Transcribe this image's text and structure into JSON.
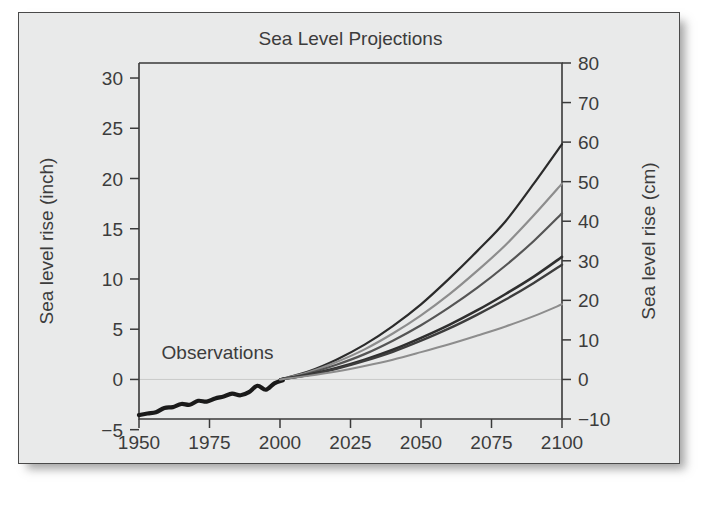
{
  "figure": {
    "title": "Sea Level Projections",
    "background_color": "#e9eaea",
    "border_color": "#4a4a4a",
    "annotation": "Observations"
  },
  "chart_data": {
    "type": "line",
    "title": "Sea Level Projections",
    "xlabel": "",
    "ylabel": "Sea level rise (inch)",
    "ylabel_right": "Sea level rise (cm)",
    "xlim": [
      1950,
      2100
    ],
    "ylim_inch": [
      -5,
      30
    ],
    "ylim_cm": [
      -10,
      80
    ],
    "grid": false,
    "legend": "none",
    "annotations": [
      {
        "text": "Observations",
        "x": 1958,
        "y_inch": 2.0
      }
    ],
    "x_ticks": [
      1950,
      1975,
      2000,
      2025,
      2050,
      2075,
      2100
    ],
    "x_ticklabels": [
      "1950",
      "1975",
      "2000",
      "2025",
      "2050",
      "2075",
      "2100"
    ],
    "y_ticks_left_inch": [
      -5,
      0,
      5,
      10,
      15,
      20,
      25,
      30
    ],
    "y_ticklabels_left": [
      "−5",
      "0",
      "5",
      "10",
      "15",
      "20",
      "25",
      "30"
    ],
    "y_ticks_right_cm": [
      -10,
      0,
      10,
      20,
      30,
      40,
      50,
      60,
      70,
      80
    ],
    "y_ticklabels_right": [
      "−10",
      "0",
      "10",
      "20",
      "30",
      "40",
      "50",
      "60",
      "70",
      "80"
    ],
    "unit_note": "left axis in inches, right axis in centimetres; 1 inch = 2.54 cm",
    "series": [
      {
        "name": "Observations",
        "color": "#1a1a1a",
        "width": 4.2,
        "x": [
          1950,
          1953,
          1956,
          1959,
          1962,
          1965,
          1968,
          1971,
          1974,
          1977,
          1980,
          1983,
          1986,
          1989,
          1992,
          1995,
          1998,
          2001
        ],
        "values_cm": [
          -9.0,
          -8.6,
          -8.3,
          -7.2,
          -7.0,
          -6.2,
          -6.4,
          -5.4,
          -5.6,
          -4.8,
          -4.3,
          -3.6,
          -4.0,
          -3.2,
          -1.6,
          -2.6,
          -1.0,
          -0.2
        ]
      },
      {
        "name": "Projection high",
        "color": "#2b2b2b",
        "width": 2.2,
        "x": [
          2000,
          2010,
          2020,
          2030,
          2040,
          2050,
          2060,
          2070,
          2080,
          2090,
          2100
        ],
        "values_cm": [
          0,
          2.0,
          5.0,
          8.8,
          13.5,
          19.0,
          25.5,
          32.5,
          40.0,
          49.5,
          59.5
        ]
      },
      {
        "name": "Projection upper-mid",
        "color": "#8d8d8d",
        "width": 2.2,
        "x": [
          2000,
          2010,
          2020,
          2030,
          2040,
          2050,
          2060,
          2070,
          2080,
          2090,
          2100
        ],
        "values_cm": [
          0,
          1.8,
          4.4,
          7.6,
          11.6,
          16.2,
          21.5,
          27.5,
          34.0,
          41.5,
          49.5
        ]
      },
      {
        "name": "Projection mid-high",
        "color": "#555555",
        "width": 2.2,
        "x": [
          2000,
          2010,
          2020,
          2030,
          2040,
          2050,
          2060,
          2070,
          2080,
          2090,
          2100
        ],
        "values_cm": [
          0,
          1.5,
          3.7,
          6.4,
          9.8,
          13.7,
          18.2,
          23.2,
          28.8,
          35.0,
          42.0
        ]
      },
      {
        "name": "Projection mid",
        "color": "#2f2f2f",
        "width": 2.6,
        "x": [
          2000,
          2010,
          2020,
          2030,
          2040,
          2050,
          2060,
          2070,
          2080,
          2090,
          2100
        ],
        "values_cm": [
          0,
          1.2,
          2.9,
          5.0,
          7.5,
          10.5,
          13.8,
          17.5,
          21.6,
          26.0,
          31.0
        ]
      },
      {
        "name": "Projection mid-low",
        "color": "#3d3d3d",
        "width": 2.4,
        "x": [
          2000,
          2010,
          2020,
          2030,
          2040,
          2050,
          2060,
          2070,
          2080,
          2090,
          2100
        ],
        "values_cm": [
          0,
          1.1,
          2.7,
          4.7,
          7.0,
          9.8,
          12.9,
          16.4,
          20.2,
          24.4,
          29.0
        ]
      },
      {
        "name": "Projection low",
        "color": "#8d8d8d",
        "width": 2.0,
        "x": [
          2000,
          2010,
          2020,
          2030,
          2040,
          2050,
          2060,
          2070,
          2080,
          2090,
          2100
        ],
        "values_cm": [
          0,
          0.9,
          2.0,
          3.4,
          5.0,
          6.9,
          8.9,
          11.1,
          13.4,
          16.0,
          19.0
        ]
      }
    ]
  }
}
